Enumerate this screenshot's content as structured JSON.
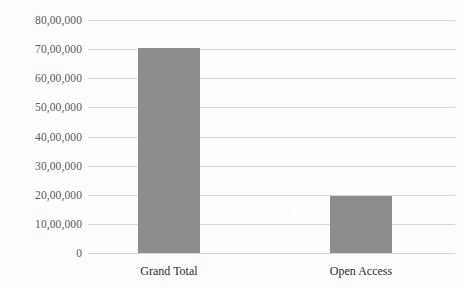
{
  "chart_data": {
    "type": "bar",
    "title": "",
    "subtitle": "",
    "xlabel": "",
    "ylabel": "",
    "categories": [
      "Grand Total",
      "Open Access"
    ],
    "values": [
      7050000,
      1950000
    ],
    "ylim": [
      0,
      8000000
    ],
    "ytick_values": [
      8000000,
      7000000,
      6000000,
      5000000,
      4000000,
      3000000,
      2000000,
      1000000,
      0
    ],
    "ytick_labels": [
      "80,00,000",
      "70,00,000",
      "60,00,000",
      "50,00,000",
      "40,00,000",
      "30,00,000",
      "20,00,000",
      "10,00,000",
      "0"
    ],
    "grid": true,
    "grid_axis": "y",
    "legend": false,
    "legend_position": "none",
    "series": [
      {
        "name": "",
        "values": [
          7050000,
          1950000
        ]
      }
    ],
    "annotations": [],
    "colors": {
      "bar_fill": "#8c8c8c",
      "gridline": "#d7d7d7",
      "background": "#fdfdfd",
      "ytick_text": "#5a5a5a",
      "xtick_text": "#2b2b2b"
    }
  }
}
